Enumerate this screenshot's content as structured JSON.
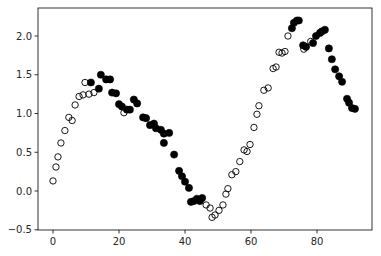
{
  "chart_data": {
    "type": "scatter",
    "title": "",
    "xlabel": "",
    "ylabel": "",
    "xlim": [
      -4,
      95
    ],
    "ylim": [
      -0.5,
      2.35
    ],
    "xticks": [
      0,
      20,
      40,
      60,
      80
    ],
    "xtick_labels": [
      "0",
      "20",
      "40",
      "60",
      "80"
    ],
    "yticks": [
      -0.5,
      0.0,
      0.5,
      1.0,
      1.5,
      2.0
    ],
    "ytick_labels": [
      "−0.5",
      "0.0",
      "0.5",
      "1.0",
      "1.5",
      "2.0"
    ],
    "grid": false,
    "legend": null,
    "series": [
      {
        "name": "open",
        "marker": "hollow-circle",
        "color": "#000000",
        "points": [
          [
            0.0,
            0.13
          ],
          [
            0.9,
            0.31
          ],
          [
            1.5,
            0.44
          ],
          [
            2.4,
            0.62
          ],
          [
            3.6,
            0.78
          ],
          [
            4.8,
            0.95
          ],
          [
            5.8,
            0.91
          ],
          [
            6.7,
            1.11
          ],
          [
            7.9,
            1.22
          ],
          [
            9.1,
            1.24
          ],
          [
            9.7,
            1.4
          ],
          [
            10.9,
            1.25
          ],
          [
            12.4,
            1.27
          ],
          [
            21.5,
            1.01
          ],
          [
            46.4,
            -0.18
          ],
          [
            47.6,
            -0.22
          ],
          [
            48.2,
            -0.34
          ],
          [
            49.1,
            -0.31
          ],
          [
            50.3,
            -0.25
          ],
          [
            51.5,
            -0.18
          ],
          [
            52.4,
            -0.04
          ],
          [
            53.0,
            0.03
          ],
          [
            54.2,
            0.21
          ],
          [
            55.4,
            0.25
          ],
          [
            56.6,
            0.38
          ],
          [
            57.9,
            0.53
          ],
          [
            58.8,
            0.51
          ],
          [
            59.7,
            0.6
          ],
          [
            60.9,
            0.82
          ],
          [
            61.8,
            0.99
          ],
          [
            62.4,
            1.1
          ],
          [
            63.9,
            1.3
          ],
          [
            65.2,
            1.33
          ],
          [
            66.7,
            1.58
          ],
          [
            67.6,
            1.6
          ],
          [
            68.5,
            1.79
          ],
          [
            69.4,
            1.78
          ],
          [
            70.3,
            1.8
          ],
          [
            71.2,
            2.0
          ],
          [
            76.0,
            1.83
          ],
          [
            78.1,
            1.93
          ]
        ]
      },
      {
        "name": "filled",
        "marker": "filled-circle",
        "color": "#000000",
        "points": [
          [
            11.5,
            1.4
          ],
          [
            13.9,
            1.32
          ],
          [
            14.5,
            1.5
          ],
          [
            16.1,
            1.44
          ],
          [
            17.3,
            1.44
          ],
          [
            17.9,
            1.27
          ],
          [
            19.1,
            1.26
          ],
          [
            20.0,
            1.12
          ],
          [
            20.9,
            1.09
          ],
          [
            22.4,
            1.05
          ],
          [
            23.3,
            1.05
          ],
          [
            24.5,
            1.18
          ],
          [
            25.5,
            1.13
          ],
          [
            27.3,
            0.95
          ],
          [
            28.2,
            0.94
          ],
          [
            29.4,
            0.85
          ],
          [
            30.6,
            0.87
          ],
          [
            31.2,
            0.81
          ],
          [
            32.7,
            0.79
          ],
          [
            33.6,
            0.74
          ],
          [
            35.2,
            0.75
          ],
          [
            33.6,
            0.62
          ],
          [
            36.7,
            0.47
          ],
          [
            38.2,
            0.26
          ],
          [
            39.1,
            0.19
          ],
          [
            40.0,
            0.12
          ],
          [
            41.2,
            0.04
          ],
          [
            41.8,
            -0.14
          ],
          [
            42.7,
            -0.13
          ],
          [
            43.6,
            -0.1
          ],
          [
            44.5,
            -0.13
          ],
          [
            45.2,
            -0.09
          ],
          [
            72.4,
            2.1
          ],
          [
            73.0,
            2.17
          ],
          [
            73.9,
            2.2
          ],
          [
            74.5,
            2.2
          ],
          [
            75.8,
            1.88
          ],
          [
            76.7,
            1.86
          ],
          [
            78.8,
            1.91
          ],
          [
            79.7,
            2.0
          ],
          [
            80.9,
            2.04
          ],
          [
            81.5,
            2.06
          ],
          [
            82.4,
            2.08
          ],
          [
            83.6,
            1.84
          ],
          [
            84.5,
            1.7
          ],
          [
            85.5,
            1.57
          ],
          [
            86.7,
            1.48
          ],
          [
            87.6,
            1.41
          ],
          [
            89.1,
            1.19
          ],
          [
            89.7,
            1.14
          ],
          [
            90.6,
            1.07
          ],
          [
            91.5,
            1.06
          ]
        ]
      }
    ]
  }
}
